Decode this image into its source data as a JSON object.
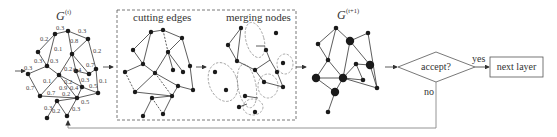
{
  "diagram": {
    "input_graph": {
      "title": "G",
      "superscript": "(t)",
      "edge_weights": [
        "0.3",
        "0.3",
        "0.2",
        "0.1",
        "0.8",
        "0.2",
        "0.3",
        "0.3",
        "0.3",
        "0.2",
        "0.7",
        "0.4",
        "0.7",
        "0.1",
        "0.3",
        "0.9",
        "0.4",
        "0.5",
        "0.1",
        "0.7",
        "0.2",
        "0.5",
        "0.3",
        "0.2",
        "0.3",
        "0.2"
      ]
    },
    "process_box": {
      "stage1_label": "cutting edges",
      "stage2_label": "merging nodes"
    },
    "output_graph": {
      "title": "G",
      "superscript": "(t+1)"
    },
    "decision": {
      "label": "accept?",
      "yes_label": "yes",
      "no_label": "no"
    },
    "result_box": {
      "label": "next layer"
    },
    "colors": {
      "edge": "#333333",
      "node": "#1a1a1a",
      "dashed": "#555555",
      "feedback": "#888888"
    }
  }
}
